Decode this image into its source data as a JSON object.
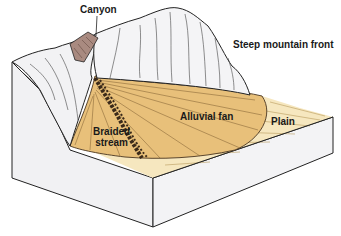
{
  "figure": {
    "labels": {
      "canyon": "Canyon",
      "steep_mountain_front": "Steep mountain front",
      "alluvial_fan": "Alluvial fan",
      "plain": "Plain",
      "braided_stream_line1": "Braided",
      "braided_stream_line2": "stream"
    },
    "colors": {
      "mountain": "#f2f2f4",
      "mountain_shade": "#e3e3e8",
      "fan": "#e8c07a",
      "fan_light": "#f0d398",
      "plain": "#f6e7bf",
      "canyon_wall": "#a98a80",
      "block_side": "#f1f1f3",
      "outline": "#222222",
      "stream": "#3b2a1a"
    }
  }
}
